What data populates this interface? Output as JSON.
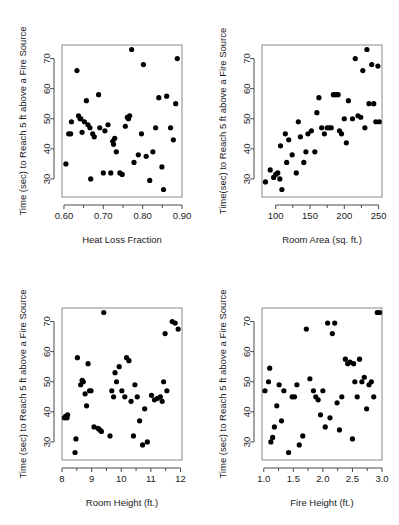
{
  "figure": {
    "layout": "2x2 panel grid of scatterplots",
    "background_color": "#ffffff",
    "point_color": "#000000",
    "frame_color": "#8a8a8a"
  },
  "chart_data": [
    {
      "type": "scatter",
      "title": "",
      "xlabel": "Heat Loss Fraction",
      "ylabel": "Time (sec) to Reach 5 ft above a Fire Source",
      "xlim": [
        0.595,
        0.9
      ],
      "ylim": [
        24.0,
        74.5
      ],
      "xticks": [
        0.6,
        0.7,
        0.8,
        0.9
      ],
      "xticklabels": [
        "0.60",
        "0.70",
        "0.80",
        "0.90"
      ],
      "xminorticks": [
        0.65,
        0.75,
        0.85
      ],
      "yticks": [
        30,
        40,
        50,
        60,
        70
      ],
      "yticklabels": [
        "30",
        "40",
        "50",
        "60",
        "70"
      ],
      "grid": false,
      "legend": "none",
      "x": [
        0.605,
        0.612,
        0.617,
        0.619,
        0.633,
        0.637,
        0.641,
        0.643,
        0.646,
        0.652,
        0.657,
        0.661,
        0.666,
        0.668,
        0.673,
        0.677,
        0.688,
        0.691,
        0.7,
        0.704,
        0.712,
        0.719,
        0.724,
        0.726,
        0.729,
        0.733,
        0.742,
        0.748,
        0.756,
        0.761,
        0.764,
        0.767,
        0.772,
        0.778,
        0.789,
        0.797,
        0.802,
        0.809,
        0.818,
        0.826,
        0.833,
        0.841,
        0.849,
        0.853,
        0.861,
        0.871,
        0.878,
        0.884,
        0.888
      ],
      "y": [
        35.0,
        45.0,
        45.0,
        49.0,
        66.0,
        51.0,
        50.0,
        50.0,
        45.5,
        49.0,
        56.0,
        48.0,
        47.0,
        30.0,
        45.0,
        44.0,
        58.0,
        47.0,
        32.0,
        46.0,
        48.0,
        32.0,
        42.5,
        41.5,
        43.5,
        39.0,
        32.0,
        31.5,
        47.5,
        50.5,
        50.0,
        51.0,
        73.0,
        35.5,
        38.0,
        45.0,
        68.0,
        37.5,
        29.5,
        39.0,
        47.0,
        57.0,
        34.0,
        26.5,
        57.5,
        47.0,
        43.0,
        55.0,
        70.0
      ]
    },
    {
      "type": "scatter",
      "title": "",
      "xlabel": "Room Area (sq. ft.)",
      "ylabel": "Time(sec) to Reach 5 ft above a Fire Source",
      "xlim": [
        80,
        255
      ],
      "ylim": [
        24.0,
        74.5
      ],
      "xticks": [
        100,
        150,
        200,
        250
      ],
      "xticklabels": [
        "100",
        "150",
        "200",
        "250"
      ],
      "xminorticks": [
        125,
        175,
        225
      ],
      "yticks": [
        30,
        40,
        50,
        60,
        70
      ],
      "yticklabels": [
        "30",
        "40",
        "50",
        "60",
        "70"
      ],
      "grid": false,
      "legend": "none",
      "x": [
        85,
        92,
        97,
        100,
        103,
        106,
        107,
        109,
        114,
        116,
        119,
        124,
        130,
        133,
        136,
        141,
        144,
        147,
        152,
        157,
        160,
        163,
        167,
        171,
        175,
        178,
        181,
        184,
        186,
        189,
        191,
        193,
        196,
        200,
        203,
        206,
        212,
        216,
        220,
        224,
        227,
        230,
        233,
        236,
        240,
        243,
        246,
        249,
        251
      ],
      "y": [
        29.0,
        33.0,
        30.5,
        31.5,
        32.0,
        30.0,
        41.0,
        26.5,
        45.0,
        35.5,
        43.0,
        38.0,
        32.0,
        49.0,
        44.0,
        35.5,
        39.0,
        45.0,
        46.0,
        39.0,
        52.0,
        57.0,
        47.0,
        45.0,
        47.0,
        47.0,
        47.0,
        58.0,
        58.0,
        58.0,
        58.0,
        46.0,
        45.0,
        50.0,
        42.0,
        56.0,
        50.0,
        70.0,
        51.0,
        50.5,
        66.0,
        47.0,
        73.0,
        55.0,
        68.0,
        55.0,
        49.0,
        67.5,
        49.0
      ]
    },
    {
      "type": "scatter",
      "title": "",
      "xlabel": "Room Height (ft.)",
      "ylabel": "Time (sec) to Reach 5 ft above a Fire Source",
      "xlim": [
        8.0,
        12.05
      ],
      "ylim": [
        24.0,
        74.5
      ],
      "xticks": [
        8,
        9,
        10,
        11,
        12
      ],
      "xticklabels": [
        "8",
        "9",
        "10",
        "11",
        "12"
      ],
      "xminorticks": [
        8.5,
        9.5,
        10.5,
        11.5
      ],
      "yticks": [
        30,
        40,
        50,
        60,
        70
      ],
      "yticklabels": [
        "30",
        "40",
        "50",
        "60",
        "70"
      ],
      "grid": false,
      "legend": "none",
      "x": [
        8.08,
        8.12,
        8.17,
        8.19,
        8.44,
        8.47,
        8.52,
        8.63,
        8.68,
        8.72,
        8.78,
        8.83,
        8.88,
        8.93,
        8.98,
        9.08,
        9.22,
        9.28,
        9.33,
        9.41,
        9.62,
        9.68,
        9.74,
        9.79,
        9.84,
        9.93,
        10.02,
        10.12,
        10.18,
        10.26,
        10.33,
        10.41,
        10.46,
        10.54,
        10.62,
        10.72,
        10.79,
        10.88,
        11.02,
        11.12,
        11.22,
        11.32,
        11.38,
        11.43,
        11.48,
        11.54,
        11.72,
        11.82,
        11.92
      ],
      "y": [
        38.0,
        38.5,
        38.0,
        39.0,
        26.5,
        31.0,
        58.0,
        49.0,
        50.5,
        50.0,
        46.0,
        42.0,
        56.0,
        47.0,
        47.0,
        35.0,
        34.5,
        34.0,
        33.5,
        73.0,
        32.0,
        47.0,
        45.0,
        53.0,
        50.0,
        55.0,
        47.0,
        45.0,
        58.0,
        57.0,
        43.5,
        32.0,
        49.0,
        45.0,
        37.0,
        29.0,
        41.0,
        30.0,
        45.5,
        44.0,
        44.5,
        45.0,
        43.5,
        50.0,
        66.0,
        47.0,
        70.0,
        69.5,
        67.5
      ]
    },
    {
      "type": "scatter",
      "title": "",
      "xlabel": "Fire Height (ft.)",
      "ylabel": "Time (sec) to Reach 5 ft above a Fire Source",
      "xlim": [
        0.97,
        3.0
      ],
      "ylim": [
        24.0,
        74.5
      ],
      "xticks": [
        1.0,
        1.5,
        2.0,
        2.5,
        3.0
      ],
      "xticklabels": [
        "1.0",
        "1.5",
        "2.0",
        "2.5",
        "3.0"
      ],
      "xminorticks": [
        1.25,
        1.75,
        2.25,
        2.75
      ],
      "yticks": [
        30,
        40,
        50,
        60,
        70
      ],
      "yticklabels": [
        "30",
        "40",
        "50",
        "60",
        "70"
      ],
      "grid": false,
      "legend": "none",
      "x": [
        1.02,
        1.08,
        1.1,
        1.12,
        1.15,
        1.18,
        1.22,
        1.26,
        1.3,
        1.34,
        1.42,
        1.48,
        1.52,
        1.56,
        1.6,
        1.66,
        1.72,
        1.78,
        1.84,
        1.88,
        1.92,
        1.96,
        2.0,
        2.04,
        2.08,
        2.12,
        2.16,
        2.2,
        2.24,
        2.28,
        2.32,
        2.38,
        2.42,
        2.46,
        2.5,
        2.52,
        2.54,
        2.58,
        2.62,
        2.66,
        2.7,
        2.74,
        2.78,
        2.82,
        2.86,
        2.92,
        2.96
      ],
      "y": [
        47.0,
        50.0,
        54.5,
        30.0,
        31.5,
        35.0,
        42.0,
        49.0,
        37.0,
        47.0,
        26.5,
        45.0,
        45.0,
        49.0,
        29.0,
        32.0,
        67.5,
        51.0,
        47.0,
        45.0,
        44.0,
        39.0,
        47.0,
        35.0,
        69.5,
        38.0,
        66.0,
        69.5,
        43.0,
        34.0,
        45.0,
        57.5,
        56.0,
        56.5,
        31.0,
        56.0,
        50.0,
        45.0,
        57.5,
        50.0,
        51.5,
        41.0,
        49.0,
        50.0,
        45.0,
        73.0,
        73.0
      ]
    }
  ]
}
